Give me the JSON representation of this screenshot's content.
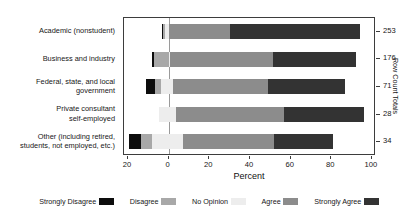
{
  "chart_title": "",
  "axis": {
    "x_title": "Percent",
    "x_ticks": [
      "20",
      "0",
      "20",
      "40",
      "60",
      "80",
      "100"
    ],
    "x_tick_values": [
      -20,
      0,
      20,
      40,
      60,
      80,
      100
    ],
    "right_axis_title": "Row Count Totals"
  },
  "legend": {
    "items": [
      {
        "label": "Strongly Disagree",
        "color": "#0d0d0d"
      },
      {
        "label": "Disagree",
        "color": "#a8a8a8"
      },
      {
        "label": "No Opinion",
        "color": "#ededed"
      },
      {
        "label": "Agree",
        "color": "#8c8c8c"
      },
      {
        "label": "Strongly Agree",
        "color": "#333333"
      }
    ]
  },
  "rows": [
    {
      "label_lines": [
        "Academic (nonstudent)"
      ],
      "count": "253",
      "start": -3.2,
      "segments": [
        {
          "name": "Strongly Disagree",
          "value": 0.4
        },
        {
          "name": "Disagree",
          "value": 0.8
        },
        {
          "name": "No Opinion",
          "value": 2.0
        },
        {
          "name": "Agree",
          "value": 30.0
        },
        {
          "name": "Strongly Agree",
          "value": 64.0
        }
      ]
    },
    {
      "label_lines": [
        "Business and industry"
      ],
      "count": "176",
      "start": -8.0,
      "segments": [
        {
          "name": "Strongly Disagree",
          "value": 0.6
        },
        {
          "name": "Disagree",
          "value": 7.4
        },
        {
          "name": "No Opinion",
          "value": 0.6
        },
        {
          "name": "Agree",
          "value": 50.5
        },
        {
          "name": "Strongly Agree",
          "value": 41.0
        }
      ]
    },
    {
      "label_lines": [
        "Federal, state, and local",
        "government"
      ],
      "count": "71",
      "start": -11.0,
      "segments": [
        {
          "name": "Strongly Disagree",
          "value": 4.2
        },
        {
          "name": "Disagree",
          "value": 2.8
        },
        {
          "name": "No Opinion",
          "value": 6.0
        },
        {
          "name": "Agree",
          "value": 47.0
        },
        {
          "name": "Strongly Agree",
          "value": 38.0
        }
      ]
    },
    {
      "label_lines": [
        "Private consultant",
        "self-employed"
      ],
      "count": "28",
      "start": -5.0,
      "segments": [
        {
          "name": "Strongly Disagree",
          "value": 0.0
        },
        {
          "name": "Disagree",
          "value": 0.0
        },
        {
          "name": "No Opinion",
          "value": 8.5
        },
        {
          "name": "Agree",
          "value": 53.0
        },
        {
          "name": "Strongly Agree",
          "value": 39.5
        }
      ]
    },
    {
      "label_lines": [
        "Other (including retired,",
        "students, not employed, etc.)"
      ],
      "count": "34",
      "start": -19.5,
      "segments": [
        {
          "name": "Strongly Disagree",
          "value": 6.0
        },
        {
          "name": "Disagree",
          "value": 5.5
        },
        {
          "name": "No Opinion",
          "value": 15.0
        },
        {
          "name": "Agree",
          "value": 45.0
        },
        {
          "name": "Strongly Agree",
          "value": 29.0
        }
      ]
    }
  ],
  "chart_data": {
    "type": "bar",
    "subtype": "diverging-stacked-likert",
    "title": "",
    "xlabel": "Percent",
    "ylabel": "",
    "xlim": [
      -22,
      102
    ],
    "grid": false,
    "legend_position": "bottom",
    "categories": [
      "Academic (nonstudent)",
      "Business and industry",
      "Federal, state, and local government",
      "Private consultant self-employed",
      "Other (including retired, students, not employed, etc.)"
    ],
    "series": [
      {
        "name": "Strongly Disagree",
        "color": "#0d0d0d",
        "values": [
          0.4,
          0.6,
          4.2,
          0.0,
          6.0
        ]
      },
      {
        "name": "Disagree",
        "color": "#a8a8a8",
        "values": [
          0.8,
          7.4,
          2.8,
          0.0,
          5.5
        ]
      },
      {
        "name": "No Opinion",
        "color": "#ededed",
        "values": [
          2.0,
          0.6,
          6.0,
          8.5,
          15.0
        ]
      },
      {
        "name": "Agree",
        "color": "#8c8c8c",
        "values": [
          30.0,
          50.5,
          47.0,
          53.0,
          45.0
        ]
      },
      {
        "name": "Strongly Agree",
        "color": "#333333",
        "values": [
          64.0,
          41.0,
          38.0,
          39.5,
          29.0
        ]
      }
    ],
    "row_count_totals": [
      253,
      176,
      71,
      28,
      34
    ],
    "right_axis_label": "Row Count Totals",
    "bar_start_offsets": [
      -3.2,
      -8.0,
      -11.0,
      -5.0,
      -19.5
    ]
  }
}
